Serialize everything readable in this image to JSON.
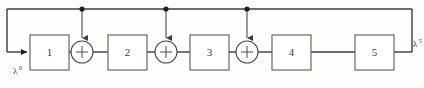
{
  "figure": {
    "type": "block-diagram",
    "background_color": "#fdfdfc",
    "line_color": "#3c3c3c",
    "box_fill": "#ffffff",
    "box_stroke": "#5a5a5a",
    "junction_color": "#1e1e1e"
  },
  "io": {
    "input_label": "λ",
    "input_superscript": "0",
    "output_label": "λ",
    "output_superscript": "5"
  },
  "blocks": [
    {
      "label": "1",
      "x": 30,
      "y": 35,
      "w": 39,
      "h": 35
    },
    {
      "label": "2",
      "x": 108,
      "y": 35,
      "w": 39,
      "h": 35
    },
    {
      "label": "3",
      "x": 190,
      "y": 35,
      "w": 39,
      "h": 35
    },
    {
      "label": "4",
      "x": 272,
      "y": 35,
      "w": 39,
      "h": 35
    },
    {
      "label": "5",
      "x": 355,
      "y": 35,
      "w": 39,
      "h": 35
    }
  ],
  "adders": [
    {
      "label": "+",
      "cx": 82,
      "cy": 52,
      "r": 11
    },
    {
      "label": "+",
      "cx": 166,
      "cy": 52,
      "r": 11
    },
    {
      "label": "+",
      "cx": 247,
      "cy": 52,
      "r": 11
    }
  ],
  "junctions": [
    {
      "x": 82,
      "y": 9
    },
    {
      "x": 166,
      "y": 9
    },
    {
      "x": 247,
      "y": 9
    }
  ],
  "bus": {
    "top_y": 9,
    "left_x": 7,
    "right_x": 412,
    "input_arrow_y": 52,
    "output_tap_y": 52
  }
}
